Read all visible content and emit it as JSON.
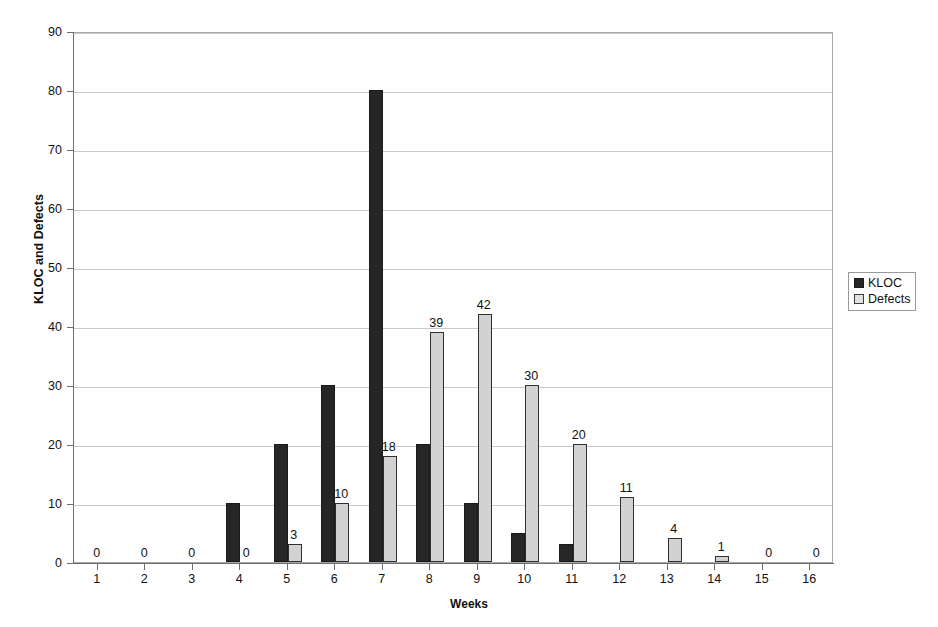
{
  "chart_data": {
    "type": "bar",
    "title": "",
    "xlabel": "Weeks",
    "ylabel": "KLOC and Defects",
    "categories": [
      "1",
      "2",
      "3",
      "4",
      "5",
      "6",
      "7",
      "8",
      "9",
      "10",
      "11",
      "12",
      "13",
      "14",
      "15",
      "16"
    ],
    "series": [
      {
        "name": "KLOC",
        "color": "#262626",
        "values": [
          0,
          0,
          0,
          10,
          20,
          30,
          80,
          20,
          10,
          5,
          3,
          0,
          0,
          0,
          0,
          0
        ]
      },
      {
        "name": "Defects",
        "color": "#d2d2d2",
        "values": [
          0,
          0,
          0,
          0,
          3,
          10,
          18,
          39,
          42,
          30,
          20,
          11,
          4,
          1,
          0,
          0
        ]
      }
    ],
    "data_labels": [
      {
        "week": "1",
        "text": "0",
        "series": "none",
        "value": 0
      },
      {
        "week": "2",
        "text": "0",
        "series": "none",
        "value": 0
      },
      {
        "week": "3",
        "text": "0",
        "series": "none",
        "value": 0
      },
      {
        "week": "4",
        "text": "0",
        "series": "Defects",
        "value": 0
      },
      {
        "week": "5",
        "text": "3",
        "series": "Defects",
        "value": 3
      },
      {
        "week": "6",
        "text": "10",
        "series": "Defects",
        "value": 10
      },
      {
        "week": "7",
        "text": "18",
        "series": "Defects",
        "value": 18
      },
      {
        "week": "8",
        "text": "39",
        "series": "Defects",
        "value": 39
      },
      {
        "week": "9",
        "text": "42",
        "series": "Defects",
        "value": 42
      },
      {
        "week": "10",
        "text": "30",
        "series": "Defects",
        "value": 30
      },
      {
        "week": "11",
        "text": "20",
        "series": "Defects",
        "value": 20
      },
      {
        "week": "12",
        "text": "11",
        "series": "Defects",
        "value": 11
      },
      {
        "week": "13",
        "text": "4",
        "series": "Defects",
        "value": 4
      },
      {
        "week": "14",
        "text": "1",
        "series": "Defects",
        "value": 1
      },
      {
        "week": "15",
        "text": "0",
        "series": "Defects",
        "value": 0
      },
      {
        "week": "16",
        "text": "0",
        "series": "Defects",
        "value": 0
      }
    ],
    "yticks": [
      0,
      10,
      20,
      30,
      40,
      50,
      60,
      70,
      80,
      90
    ],
    "ytick_labels": [
      "0",
      "10",
      "20",
      "30",
      "40",
      "50",
      "60",
      "70",
      "80",
      "90"
    ],
    "ylim": [
      0,
      90
    ],
    "grid": true,
    "grid_axis": "y",
    "legend_position": "right",
    "legend_entries": [
      "KLOC",
      "Defects"
    ],
    "colors": {
      "kloc": "#262626",
      "defects": "#d2d2d2",
      "gridline": "#c9c9c9",
      "axis": "#6e6e6e",
      "text": "#111111",
      "background": "#ffffff"
    }
  },
  "axes": {
    "x_title": "Weeks",
    "y_title": "KLOC and Defects"
  },
  "legend": {
    "items": [
      {
        "label": "KLOC",
        "swatch": "kloc-swatch"
      },
      {
        "label": "Defects",
        "swatch": "defects-swatch"
      }
    ]
  }
}
